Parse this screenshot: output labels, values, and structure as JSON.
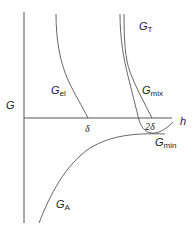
{
  "diagram": {
    "type": "energy-vs-separation",
    "axes": {
      "y_label": "G",
      "x_label": "h",
      "x_ticks": [
        {
          "label": "δ",
          "x": 88
        },
        {
          "label": "2δ",
          "x": 150
        }
      ]
    },
    "curves": [
      {
        "id": "G_el",
        "label_main": "G",
        "label_sub": "el",
        "description": "steric elastic term, decreasing to zero at h=δ"
      },
      {
        "id": "G_mix",
        "label_main": "G",
        "label_sub": "mix",
        "description": "mixing term, decreasing to zero at h=2δ"
      },
      {
        "id": "G_T",
        "label_main": "G",
        "label_sub": "T",
        "description": "total energy, with minimum near 2δ"
      },
      {
        "id": "G_A",
        "label_main": "G",
        "label_sub": "A",
        "description": "attractive van der Waals term, negative"
      }
    ],
    "annotations": [
      {
        "label_main": "G",
        "label_sub": "min",
        "description": "energy minimum"
      }
    ],
    "colors": {
      "line": "#555555",
      "text": "#222222",
      "background": "#ffffff"
    }
  }
}
